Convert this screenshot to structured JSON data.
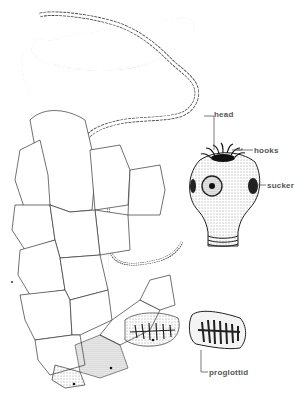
{
  "figure": {
    "labels": {
      "head": "head",
      "hooks": "hooks",
      "sucker": "sucker",
      "proglottid": "proglottid"
    }
  }
}
